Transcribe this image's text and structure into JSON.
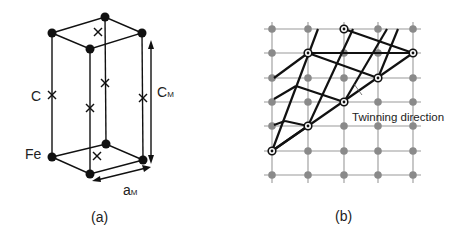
{
  "figure_a": {
    "caption": "(a)",
    "label_c": "C",
    "label_fe": "Fe",
    "label_cm_main": "C",
    "label_cm_sub": "M",
    "label_am_main": "a",
    "label_am_sub": "M"
  },
  "figure_b": {
    "caption": "(b)",
    "annotation": "Twinning direction"
  },
  "colors": {
    "line": "#111111",
    "grid": "#999999",
    "grid_atom": "#8a8a8a"
  }
}
